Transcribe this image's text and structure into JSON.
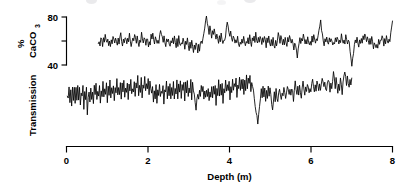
{
  "figure": {
    "background_color": "#ffffff",
    "ink_color": "#000000",
    "width": 409,
    "height": 183
  },
  "axes": {
    "x": {
      "title": "Depth (m)",
      "ticks": [
        {
          "value": 0,
          "label": "0"
        },
        {
          "value": 2,
          "label": "2"
        },
        {
          "value": 4,
          "label": "4"
        },
        {
          "value": 6,
          "label": "6"
        },
        {
          "value": 8,
          "label": "8"
        }
      ],
      "range_min": 0,
      "range_max": 8
    },
    "y_upper": {
      "title_main": "CaCO",
      "title_sub": "3",
      "title_percent": "%",
      "ticks": [
        {
          "value": 80,
          "label": "80"
        },
        {
          "value": 60,
          "label": ""
        },
        {
          "value": 40,
          "label": "40"
        }
      ],
      "range_min": 30,
      "range_max": 88
    },
    "y_lower": {
      "title": "Transmission",
      "ticks": []
    }
  },
  "chart_data": {
    "type": "line",
    "title": "",
    "subtitle": "",
    "xlabel": "Depth (m)",
    "ylabel": "% CaCO3 / Transmission",
    "xlim": [
      0,
      8
    ],
    "grid": false,
    "legend": "none",
    "x_tick_labels": [
      "0",
      "2",
      "4",
      "6",
      "8"
    ],
    "x_tick_values": [
      0,
      2,
      4,
      6,
      8
    ],
    "series": [
      {
        "name": "% CaCO3",
        "axis": "y_upper",
        "ylabel": "% CaCO3",
        "ylim": [
          30,
          88
        ],
        "y_tick_values": [
          40,
          60,
          80
        ],
        "y_tick_labels": [
          "40",
          "",
          "80"
        ],
        "x_start": 0.78,
        "x_end": 8.0,
        "sample_spacing": 0.0215,
        "mean": 61,
        "std": 6.2,
        "values": [
          58,
          61,
          57,
          63,
          60,
          56,
          62,
          59,
          65,
          61,
          58,
          63,
          57,
          60,
          55,
          62,
          58,
          64,
          60,
          57,
          63,
          59,
          55,
          61,
          58,
          62,
          66,
          60,
          57,
          63,
          59,
          64,
          61,
          57,
          62,
          58,
          65,
          61,
          56,
          60,
          63,
          59,
          65,
          62,
          58,
          64,
          60,
          56,
          62,
          59,
          66,
          63,
          59,
          64,
          61,
          57,
          63,
          60,
          56,
          61,
          58,
          64,
          60,
          67,
          63,
          59,
          65,
          61,
          57,
          62,
          59,
          64,
          70,
          66,
          62,
          58,
          63,
          60,
          56,
          61,
          58,
          63,
          59,
          55,
          60,
          57,
          62,
          58,
          64,
          60,
          56,
          61,
          57,
          63,
          59,
          55,
          60,
          56,
          62,
          58,
          54,
          59,
          56,
          61,
          57,
          53,
          58,
          55,
          60,
          56,
          52,
          57,
          54,
          59,
          55,
          51,
          56,
          53,
          58,
          61,
          57,
          63,
          68,
          72,
          76,
          80,
          75,
          70,
          66,
          71,
          67,
          63,
          68,
          64,
          70,
          66,
          62,
          67,
          63,
          59,
          64,
          60,
          65,
          61,
          57,
          62,
          59,
          65,
          70,
          75,
          71,
          67,
          63,
          68,
          64,
          60,
          65,
          61,
          57,
          62,
          58,
          63,
          59,
          55,
          60,
          57,
          62,
          58,
          64,
          60,
          56,
          61,
          58,
          63,
          59,
          65,
          61,
          57,
          62,
          59,
          64,
          60,
          66,
          62,
          58,
          63,
          60,
          65,
          61,
          57,
          62,
          59,
          64,
          60,
          56,
          61,
          58,
          63,
          59,
          55,
          60,
          57,
          62,
          58,
          54,
          59,
          56,
          61,
          66,
          62,
          58,
          63,
          60,
          56,
          61,
          58,
          64,
          60,
          56,
          62,
          59,
          65,
          61,
          57,
          62,
          58,
          54,
          59,
          56,
          51,
          47,
          52,
          57,
          62,
          58,
          63,
          59,
          65,
          61,
          57,
          62,
          58,
          64,
          60,
          56,
          61,
          58,
          63,
          59,
          65,
          61,
          57,
          62,
          59,
          64,
          68,
          72,
          76,
          70,
          65,
          61,
          57,
          62,
          58,
          64,
          60,
          56,
          61,
          58,
          63,
          59,
          55,
          60,
          57,
          62,
          58,
          64,
          60,
          56,
          62,
          59,
          65,
          61,
          57,
          62,
          59,
          64,
          60,
          56,
          61,
          58,
          52,
          46,
          40,
          45,
          51,
          57,
          62,
          58,
          63,
          59,
          55,
          60,
          57,
          62,
          59,
          64,
          60,
          66,
          62,
          58,
          63,
          60,
          56,
          61,
          58,
          63,
          59,
          55,
          60,
          57,
          53,
          58,
          55,
          60,
          57,
          62,
          59,
          64,
          61,
          57,
          63,
          59,
          65,
          61,
          57,
          63,
          60,
          66,
          72,
          78
        ]
      },
      {
        "name": "Transmission",
        "axis": "y_lower",
        "ylabel": "Transmission",
        "x_start": 0.02,
        "x_end": 7.0,
        "sample_spacing": 0.0205,
        "mean": 50,
        "std": 7.0,
        "values": [
          52,
          46,
          58,
          44,
          55,
          41,
          57,
          48,
          60,
          43,
          56,
          47,
          62,
          45,
          58,
          40,
          54,
          49,
          61,
          38,
          52,
          46,
          57,
          30,
          48,
          55,
          43,
          59,
          47,
          53,
          41,
          58,
          50,
          62,
          46,
          54,
          48,
          60,
          44,
          57,
          51,
          63,
          47,
          55,
          49,
          61,
          45,
          58,
          52,
          64,
          48,
          56,
          50,
          62,
          46,
          59,
          53,
          65,
          49,
          57,
          51,
          63,
          47,
          60,
          54,
          66,
          50,
          58,
          52,
          64,
          48,
          61,
          55,
          67,
          51,
          59,
          53,
          65,
          49,
          62,
          56,
          68,
          52,
          60,
          54,
          66,
          50,
          63,
          57,
          69,
          53,
          61,
          55,
          67,
          51,
          64,
          58,
          52,
          60,
          46,
          55,
          49,
          61,
          43,
          57,
          51,
          63,
          47,
          56,
          50,
          62,
          44,
          58,
          52,
          64,
          48,
          57,
          51,
          63,
          45,
          59,
          53,
          65,
          49,
          58,
          52,
          64,
          46,
          60,
          54,
          66,
          50,
          59,
          53,
          65,
          47,
          61,
          55,
          67,
          51,
          60,
          54,
          66,
          48,
          62,
          56,
          50,
          44,
          38,
          46,
          54,
          48,
          56,
          50,
          58,
          52,
          60,
          46,
          55,
          49,
          57,
          51,
          59,
          45,
          53,
          47,
          61,
          49,
          57,
          51,
          59,
          43,
          55,
          49,
          63,
          51,
          59,
          53,
          61,
          45,
          57,
          51,
          65,
          53,
          61,
          55,
          63,
          47,
          59,
          53,
          67,
          55,
          63,
          57,
          65,
          49,
          61,
          55,
          69,
          57,
          65,
          59,
          67,
          51,
          63,
          57,
          71,
          59,
          67,
          61,
          69,
          53,
          65,
          59,
          53,
          47,
          41,
          35,
          29,
          23,
          31,
          39,
          47,
          55,
          49,
          57,
          51,
          59,
          45,
          53,
          47,
          61,
          49,
          57,
          51,
          43,
          37,
          45,
          53,
          47,
          55,
          49,
          43,
          51,
          59,
          53,
          47,
          55,
          49,
          57,
          51,
          45,
          53,
          61,
          55,
          49,
          57,
          51,
          59,
          53,
          47,
          55,
          63,
          57,
          51,
          59,
          53,
          61,
          55,
          49,
          57,
          65,
          59,
          53,
          61,
          55,
          63,
          57,
          51,
          59,
          53,
          61,
          67,
          61,
          55,
          63,
          57,
          65,
          59,
          53,
          61,
          55,
          63,
          69,
          63,
          57,
          65,
          59,
          53,
          61,
          67,
          61,
          55,
          63,
          57,
          65,
          71,
          65,
          59,
          67,
          61,
          55,
          63,
          57,
          65,
          59,
          53,
          61,
          67,
          73,
          67,
          61,
          69,
          63,
          57,
          65,
          59,
          67
        ]
      }
    ]
  }
}
